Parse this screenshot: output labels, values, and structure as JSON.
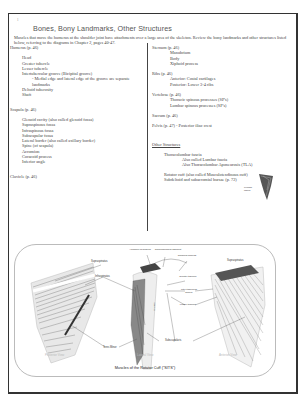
{
  "page": {
    "number": "1",
    "title": "Bones, Bony Landmarks, Other Structures",
    "intro": "Muscles that move the humerus at the shoulder joint have attachments over a large area of the skeleton. Review the bony landmarks and other structures listed below, referring to the diagrams in Chapter 2, pages 40-47."
  },
  "left_column": {
    "humerus": {
      "heading": "Humerus (p. 46)",
      "items": [
        "Head",
        "Greater tubercle",
        "Lesser tubercle",
        "Intertubercular groove (Bicipital groove)"
      ],
      "note": "- Medial edge and lateral edge of the groove are separate landmarks",
      "items_after": [
        "Deltoid tuberosity",
        "Shaft"
      ]
    },
    "scapula": {
      "heading": "Scapula (p. 46)",
      "items": [
        "Glenoid cavity (also called glenoid fossa)",
        "Supraspinous fossa",
        "Infraspinous fossa",
        "Subscapular fossa",
        "Lateral border (also called axillary border)",
        "Spine (of scapula)",
        "Acromion",
        "Coracoid process",
        "Inferior angle"
      ]
    },
    "clavicle": {
      "heading": "Clavicle (p. 46)"
    }
  },
  "right_column": {
    "sternum": {
      "heading": "Sternum (p. 46)",
      "items": [
        "Manubrium",
        "Body",
        "Xiphoid process"
      ]
    },
    "ribs": {
      "heading": "Ribs (p. 46)",
      "items": [
        "Anterior: Costal cartilages",
        "Posterior: Lower 3-4 ribs"
      ]
    },
    "vertebrae": {
      "heading": "Vertebrae (p. 46)",
      "items": [
        "Thoracic spinous processes (SP's)",
        "Lumbar spinous processes (SP's)"
      ]
    },
    "sacrum": {
      "heading": "Sacrum (p. 46)"
    },
    "pelvis": {
      "heading": "Pelvis (p. 47) - Posterior iliac crest"
    },
    "other": {
      "heading": "Other Structures",
      "thoracolumbar": "Thoracolumbar fascia",
      "aka1": "Also called Lumbar fascia",
      "aka2": "Also Thoracolumbar Aponeurosis (TLA)",
      "rotator": "Rotator cuff (also called Musculotendinous cuff)",
      "bursae": "Subdeltoid and subacromial bursae (p. 72)"
    },
    "lumbar_fascia_label": "Lumbar fascia"
  },
  "figure": {
    "caption": "Muscles of the Rotator Cuff (\"SITS\")",
    "views": [
      "Posterior View",
      "Lateral View",
      "Anterior View"
    ],
    "labels": {
      "supraspinatus_left": "Supraspinatus",
      "infraspinatus": "Infraspinatus",
      "teres_minor": "Teres Minor",
      "acromion": "Acromion of scapula",
      "coracoacromial": "Coracoacromial ligament",
      "coracoid": "Coracoid process",
      "greater_tubercle": "Greater tubercle",
      "inter_groove": "Inter-tubercular groove",
      "lesser_tubercle": "Lesser tubercle",
      "subscapularis": "Subscapularis",
      "supraspinatus_right": "Supraspinatus",
      "scapula": "Scapula"
    }
  }
}
